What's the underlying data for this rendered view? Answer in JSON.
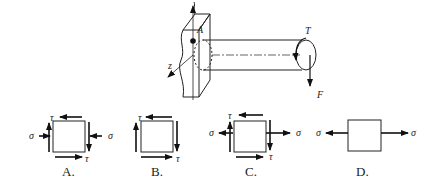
{
  "figure": {
    "shaft": {
      "point_label": "A",
      "axis_label": "z",
      "torque_label": "T",
      "force_label": "F"
    },
    "options": [
      {
        "label": "A.",
        "sigma_left": "σ",
        "sigma_right": "σ",
        "tau_top": "τ",
        "tau_bottom": "τ"
      },
      {
        "label": "B.",
        "tau_top": "τ",
        "tau_bottom": "τ"
      },
      {
        "label": "C.",
        "sigma_left": "σ",
        "sigma_right": "σ",
        "tau_top": "τ",
        "tau_bottom": "τ"
      },
      {
        "label": "D.",
        "sigma_left": "σ",
        "sigma_right": "σ"
      }
    ]
  }
}
